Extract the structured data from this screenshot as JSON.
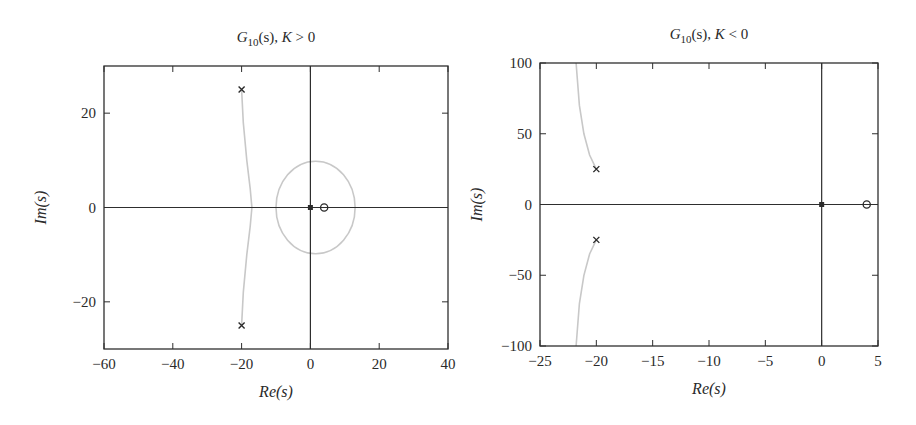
{
  "chart_data": [
    {
      "type": "scatter",
      "title": "G10(s), K > 0",
      "title_parts": {
        "main": "G",
        "sub": "10",
        "rest": "(s), ",
        "k": "K",
        "cond": " > 0"
      },
      "xlabel": "Re(s)",
      "ylabel": "Im(s)",
      "xlim": [
        -60,
        40
      ],
      "ylim": [
        -30,
        30
      ],
      "xticks": [
        -60,
        -40,
        -20,
        0,
        20,
        40
      ],
      "yticks": [
        -20,
        0,
        20
      ],
      "grid": false,
      "poles": [
        [
          -20,
          25
        ],
        [
          -20,
          -25
        ],
        [
          0,
          0
        ]
      ],
      "zeros": [
        [
          4,
          0
        ]
      ],
      "loci": [
        {
          "name": "upper branch",
          "points": [
            [
              -20,
              25
            ],
            [
              -19.5,
              18
            ],
            [
              -18.5,
              10
            ],
            [
              -17.5,
              4
            ],
            [
              -17,
              0
            ]
          ]
        },
        {
          "name": "lower branch",
          "points": [
            [
              -17,
              0
            ],
            [
              -17.5,
              -4
            ],
            [
              -18.5,
              -10
            ],
            [
              -19.5,
              -18
            ],
            [
              -20,
              -25
            ]
          ]
        },
        {
          "name": "circle around origin",
          "center": [
            1.5,
            0
          ],
          "rx": 11.5,
          "ry": 9.8
        }
      ],
      "frame": {
        "x": 104,
        "y": 66,
        "w": 344,
        "h": 283
      }
    },
    {
      "type": "scatter",
      "title": "G10(s), K < 0",
      "title_parts": {
        "main": "G",
        "sub": "10",
        "rest": "(s), ",
        "k": "K",
        "cond": " < 0"
      },
      "xlabel": "Re(s)",
      "ylabel": "Im(s)",
      "xlim": [
        -25,
        5
      ],
      "ylim": [
        -100,
        100
      ],
      "xticks": [
        -25,
        -20,
        -15,
        -10,
        -5,
        0,
        5
      ],
      "yticks": [
        -100,
        -50,
        0,
        50,
        100
      ],
      "grid": false,
      "poles": [
        [
          -20,
          25
        ],
        [
          -20,
          -25
        ],
        [
          0,
          0
        ]
      ],
      "zeros": [
        [
          4,
          0
        ]
      ],
      "loci": [
        {
          "name": "upper branch",
          "points": [
            [
              -20,
              25
            ],
            [
              -20.6,
              35
            ],
            [
              -21.1,
              50
            ],
            [
              -21.5,
              70
            ],
            [
              -21.7,
              90
            ],
            [
              -21.8,
              100
            ]
          ]
        },
        {
          "name": "lower branch",
          "points": [
            [
              -20,
              -25
            ],
            [
              -20.6,
              -35
            ],
            [
              -21.1,
              -50
            ],
            [
              -21.5,
              -70
            ],
            [
              -21.7,
              -90
            ],
            [
              -21.8,
              -100
            ]
          ]
        }
      ],
      "frame": {
        "x": 540,
        "y": 63,
        "w": 338,
        "h": 283
      }
    }
  ],
  "colors": {
    "axis": "#2e2e2e",
    "locus": "#c8c8c8",
    "marker": "#2a2a2a"
  }
}
